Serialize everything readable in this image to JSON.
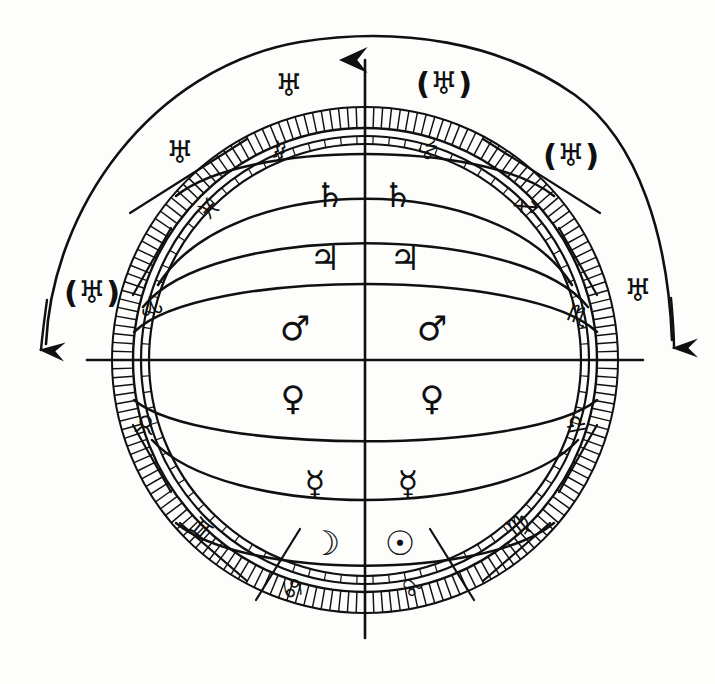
{
  "diagram": {
    "style": "hand-drawn ink line art",
    "ink_color": "#101010",
    "background_color": "#fdfdfc",
    "center_x": 365,
    "center_y": 360
  },
  "planet_bands": {
    "description": "Concentric bands of planetary spheres, each labelled twice (left and right of vertical axis)",
    "bands": [
      {
        "index": 0,
        "name": "Saturn",
        "symbol": "♄",
        "left_label": "♄",
        "right_label": "♄",
        "left_x": 330,
        "left_y": 195,
        "right_x": 398,
        "right_y": 195
      },
      {
        "index": 1,
        "name": "Jupiter",
        "symbol": "♃",
        "left_label": "♃",
        "right_label": "♃",
        "left_x": 325,
        "left_y": 258,
        "right_x": 405,
        "right_y": 258
      },
      {
        "index": 2,
        "name": "Mars",
        "symbol": "♂",
        "left_label": "♂",
        "right_label": "♂",
        "left_x": 295,
        "left_y": 328,
        "right_x": 432,
        "right_y": 328
      },
      {
        "index": 3,
        "name": "Venus",
        "symbol": "♀",
        "left_label": "♀",
        "right_label": "♀",
        "left_x": 293,
        "left_y": 398,
        "right_x": 432,
        "right_y": 398
      },
      {
        "index": 4,
        "name": "Mercury",
        "symbol": "☿",
        "left_label": "☿",
        "right_label": "☿",
        "left_x": 315,
        "left_y": 483,
        "right_x": 408,
        "right_y": 483
      },
      {
        "index": 5,
        "name": "Moon and Sun",
        "symbol": "☽",
        "left_label": "☽",
        "right_label": "☉",
        "left_x": 325,
        "left_y": 543,
        "right_x": 400,
        "right_y": 543
      }
    ]
  },
  "zodiac_ring": {
    "description": "Twelve zodiac signs placed around the outer degree ring",
    "radius": 253,
    "signs": [
      {
        "name": "Aquarius",
        "symbol": "♒",
        "angle_deg": 104,
        "x": 279,
        "y": 150
      },
      {
        "name": "Capricorn",
        "symbol": "♑",
        "angle_deg": 76,
        "x": 428,
        "y": 150
      },
      {
        "name": "Sagittarius",
        "symbol": "♐",
        "angle_deg": 50,
        "x": 525,
        "y": 207
      },
      {
        "name": "Scorpio",
        "symbol": "♏",
        "angle_deg": 22,
        "x": 578,
        "y": 315
      },
      {
        "name": "Libra",
        "symbol": "♎",
        "angle_deg": -11,
        "x": 576,
        "y": 424
      },
      {
        "name": "Virgo",
        "symbol": "♍",
        "angle_deg": -38,
        "x": 518,
        "y": 525
      },
      {
        "name": "Leo",
        "symbol": "♌",
        "angle_deg": -66,
        "x": 412,
        "y": 588
      },
      {
        "name": "Cancer",
        "symbol": "♋",
        "angle_deg": -105,
        "x": 293,
        "y": 588
      },
      {
        "name": "Gemini",
        "symbol": "♊",
        "angle_deg": -140,
        "x": 202,
        "y": 528
      },
      {
        "name": "Taurus",
        "symbol": "♉",
        "angle_deg": -169,
        "x": 145,
        "y": 424
      },
      {
        "name": "Aries",
        "symbol": "♈",
        "angle_deg": 168,
        "x": 151,
        "y": 305
      },
      {
        "name": "Pisces",
        "symbol": "♓",
        "angle_deg": 135,
        "x": 208,
        "y": 208
      }
    ]
  },
  "uranus_markers": {
    "description": "Four Uranus symbols outside the zodiac ring, two plain and two parenthesised, with curved arrows indicating motion",
    "symbol": "♅",
    "markers": [
      {
        "id": "upper-left",
        "label": "♅",
        "parenthesised": false,
        "x": 180,
        "y": 152
      },
      {
        "id": "upper-right",
        "label": "(♅)",
        "parenthesised": true,
        "x": 444,
        "y": 83
      },
      {
        "id": "top-left",
        "label": "♅",
        "parenthesised": false,
        "x": 289,
        "y": 85
      },
      {
        "id": "right-upper",
        "label": "(♅)",
        "parenthesised": true,
        "x": 571,
        "y": 155
      },
      {
        "id": "left-outer",
        "label": "(♅)",
        "parenthesised": true,
        "x": 92,
        "y": 292
      },
      {
        "id": "right-outer",
        "label": "♅",
        "parenthesised": false,
        "x": 638,
        "y": 290
      }
    ]
  },
  "axes": {
    "vertical": {
      "name": "vertical-axis-with-arrow",
      "has_arrowhead": true,
      "arrow_direction": "up",
      "top_y": 48,
      "bottom_y": 638
    },
    "horizontal": {
      "name": "horizontal-axis",
      "left_x": 87,
      "right_x": 643,
      "y": 360
    }
  },
  "motion_arrows": [
    {
      "id": "left-motion-arrow",
      "direction": "down-left",
      "tip_x": 40,
      "tip_y": 356
    },
    {
      "id": "right-motion-arrow",
      "direction": "down-right",
      "tip_x": 673,
      "tip_y": 354
    }
  ],
  "rings": {
    "degree_ring_outer_radius": 253,
    "degree_ring_inner_radius": 232,
    "double_ring_radius": 222,
    "tick_count": 180
  }
}
